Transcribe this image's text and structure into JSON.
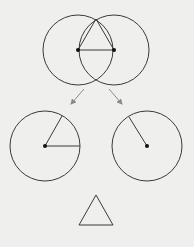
{
  "colors": {
    "background": "#efefed",
    "stroke": "#3a3a3a",
    "arrow": "#8a8a8a"
  },
  "diagram": {
    "top": {
      "circles": [
        {
          "cx": 78,
          "cy": 50,
          "r": 35
        },
        {
          "cx": 114,
          "cy": 50,
          "r": 35
        }
      ],
      "points": [
        {
          "x": 78,
          "y": 50
        },
        {
          "x": 114,
          "y": 50
        }
      ],
      "triangle": [
        [
          96,
          19
        ],
        [
          78,
          50
        ],
        [
          114,
          50
        ]
      ]
    },
    "arrows": [
      {
        "x1": 84,
        "y1": 89,
        "x2": 71,
        "y2": 104
      },
      {
        "x1": 109,
        "y1": 89,
        "x2": 122,
        "y2": 104
      }
    ],
    "bottom_left": {
      "cx": 45,
      "cy": 146,
      "r": 35,
      "radii": [
        [
          80,
          146
        ],
        [
          62,
          116
        ]
      ]
    },
    "bottom_right": {
      "cx": 147,
      "cy": 146,
      "r": 35,
      "radii": [
        [
          129,
          117
        ]
      ]
    },
    "result_triangle": [
      [
        96,
        195
      ],
      [
        79,
        225
      ],
      [
        113,
        225
      ]
    ]
  }
}
